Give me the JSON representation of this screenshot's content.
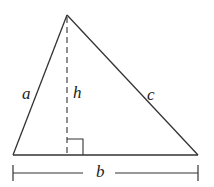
{
  "diagram": {
    "type": "triangle-with-altitude",
    "colors": {
      "stroke": "#333333",
      "background": "#ffffff"
    },
    "vertices": {
      "apex": [
        67,
        15
      ],
      "bottom_left": [
        13,
        155
      ],
      "bottom_right": [
        198,
        155
      ],
      "altitude_foot": [
        67,
        155
      ]
    },
    "labels": {
      "side_a": "a",
      "side_c": "c",
      "height": "h",
      "base": "b"
    },
    "right_angle_marker": {
      "x": 67,
      "y": 139,
      "size": 16
    },
    "base_dimension": {
      "y": 173,
      "left": 13,
      "right": 198
    }
  }
}
